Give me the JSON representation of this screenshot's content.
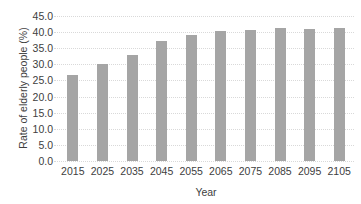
{
  "chart_data": {
    "type": "bar",
    "title": "",
    "xlabel": "Year",
    "ylabel": "Rate of elderly people (%)",
    "categories": [
      "2015",
      "2025",
      "2035",
      "2045",
      "2055",
      "2065",
      "2075",
      "2085",
      "2095",
      "2105"
    ],
    "values": [
      26.7,
      30.1,
      33.0,
      37.4,
      39.1,
      40.2,
      40.7,
      41.3,
      41.0,
      41.2
    ],
    "ylim": [
      0,
      45
    ],
    "yticks": [
      0,
      5,
      10,
      15,
      20,
      25,
      30,
      35,
      40,
      45
    ],
    "ytick_labels": [
      "0.0",
      "5.0",
      "10.0",
      "15.0",
      "20.0",
      "25.0",
      "30.0",
      "35.0",
      "40.0",
      "45.0"
    ],
    "grid": "horizontal-dotted",
    "legend": "none",
    "colors": {
      "bar": "#a5a5a5",
      "gridline": "#d9d9d9",
      "text": "#404040",
      "background": "#ffffff"
    }
  }
}
